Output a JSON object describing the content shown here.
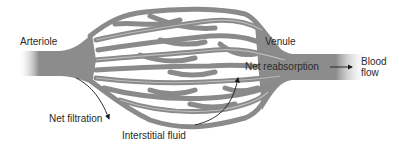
{
  "diagram": {
    "type": "capillary-bed",
    "labels": {
      "arteriole": "Arteriole",
      "venule": "Venule",
      "net_filtration": "Net filtration",
      "net_reabsorption": "Net reabsorption",
      "interstitial_fluid": "Interstitial fluid",
      "blood_flow_line1": "Blood",
      "blood_flow_line2": "flow"
    },
    "colors": {
      "vessel": "#8a8a8a",
      "vessel_edge": "#6e6e6e",
      "vessel_light": "#b5b5b5",
      "text": "#2a2a2a",
      "arrow": "#1a1a1a",
      "background": "#ffffff"
    }
  }
}
